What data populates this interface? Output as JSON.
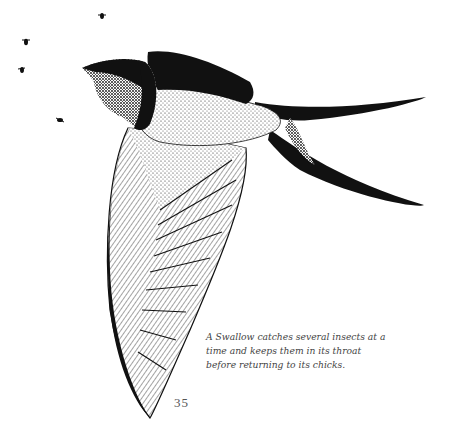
{
  "illustration": {
    "subject": "Swallow in flight catching insects",
    "ink_color": "#111111",
    "paper_color": "#ffffff",
    "insects_count": 5
  },
  "caption": {
    "text": "A Swallow catches several insects at a time and keeps them in its throat before returning to its chicks."
  },
  "page_number": "35"
}
